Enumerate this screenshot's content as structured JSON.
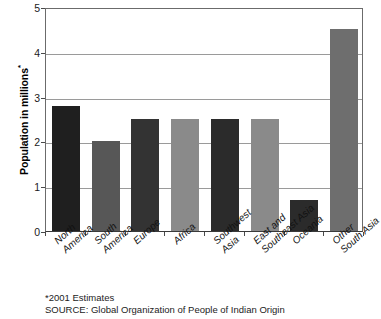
{
  "chart_data": {
    "type": "bar",
    "title": "",
    "xlabel": "",
    "ylabel": "Population in millions",
    "ylabel_superscript": "*",
    "ylim": [
      0,
      5
    ],
    "yticks": [
      "0",
      "1",
      "2",
      "3",
      "4",
      "5"
    ],
    "ytick_values": [
      0,
      1,
      2,
      3,
      4,
      5
    ],
    "grid": true,
    "legend": "none",
    "categories": [
      "North America",
      "South America",
      "Europe",
      "Africa",
      "Southwest Asia",
      "East and Southeast Asia",
      "Oceania",
      "Other South Asia"
    ],
    "category_lines": [
      [
        "North",
        "America"
      ],
      [
        "South",
        "America"
      ],
      [
        "Europe",
        ""
      ],
      [
        "Africa",
        ""
      ],
      [
        "Southwest",
        "Asia"
      ],
      [
        "East and",
        "Southeast Asia"
      ],
      [
        "Oceania",
        ""
      ],
      [
        "Other",
        "South Asia"
      ]
    ],
    "values": [
      2.8,
      2.0,
      2.5,
      2.5,
      2.5,
      2.5,
      0.7,
      4.5
    ],
    "bar_colors": [
      "#1f1f1f",
      "#575757",
      "#333333",
      "#8a8a8a",
      "#2b2b2b",
      "#8a8a8a",
      "#2b2b2b",
      "#6e6e6e"
    ]
  },
  "footer": {
    "note": "*2001 Estimates",
    "source": "SOURCE: Global Organization of People of Indian Origin"
  },
  "style": {
    "axis_color": "#6b6b6b",
    "grid_color": "#9a9a9a",
    "background": "#ffffff"
  }
}
